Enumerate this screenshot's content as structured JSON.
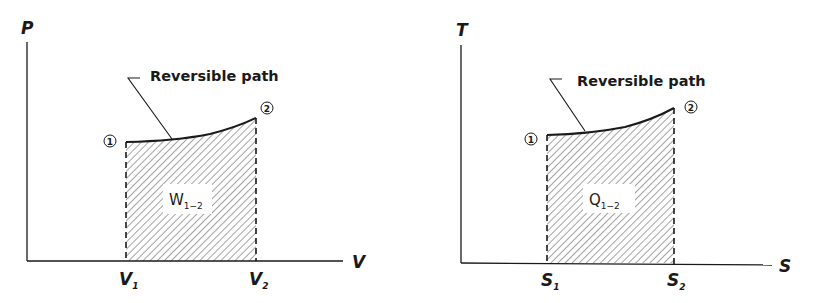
{
  "diagrams": [
    {
      "id": "pv",
      "y_axis_label": "P",
      "x_axis_label": "V",
      "x_tick_1": {
        "main": "V",
        "sub": "1"
      },
      "x_tick_2": {
        "main": "V",
        "sub": "2"
      },
      "state_1": "1",
      "state_2": "2",
      "path_label": "Reversible path",
      "area_label": {
        "main": "W",
        "sub": "1−2"
      }
    },
    {
      "id": "ts",
      "y_axis_label": "T",
      "x_axis_label": "S",
      "x_tick_1": {
        "main": "S",
        "sub": "1"
      },
      "x_tick_2": {
        "main": "S",
        "sub": "2"
      },
      "state_1": "1",
      "state_2": "2",
      "path_label": "Reversible path",
      "area_label": {
        "main": "Q",
        "sub": "1−2"
      }
    }
  ],
  "colors": {
    "ink": "#1a1a1a",
    "hatch": "#555555",
    "background": "#ffffff"
  }
}
